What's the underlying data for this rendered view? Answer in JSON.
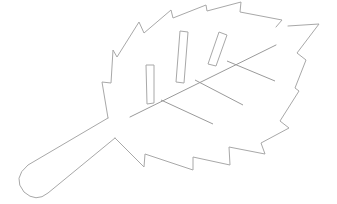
{
  "illustration": {
    "subject": "leaf",
    "style": "line-art",
    "colors": {
      "background": "#ffffff",
      "outline": "#a8a8a8",
      "veins": "#9a9a9a"
    },
    "stroke_width": 1,
    "outline_points": "108,118 102,82 111,83 113,50 117,57 139,22 144,33 171,10 173,18 206,5 207,11 241,2 240,12 282,20 276,27",
    "outline_points_2": "288,26 319,24 297,53 306,60 295,88 299,91 280,121 289,128 261,143 265,154 229,147 230,165 193,157 193,170 145,154 144,167 115,138",
    "handle_path": "M108,118 L28,165 Q12,178 24,192 Q36,203 48,193 L115,138",
    "midrib": {
      "x1": 130,
      "y1": 117,
      "x2": 276,
      "y2": 45
    },
    "veins": [
      {
        "x1": 161,
        "y1": 100,
        "x2": 213,
        "y2": 124
      },
      {
        "x1": 195,
        "y1": 80,
        "x2": 243,
        "y2": 105
      },
      {
        "x1": 227,
        "y1": 61,
        "x2": 275,
        "y2": 81
      }
    ],
    "bars": [
      {
        "points": "146,65 154,65 154,103 147,104"
      },
      {
        "points": "180,31 188,32 184,83 176,82"
      },
      {
        "points": "219,32 227,35 216,66 208,64"
      }
    ]
  }
}
